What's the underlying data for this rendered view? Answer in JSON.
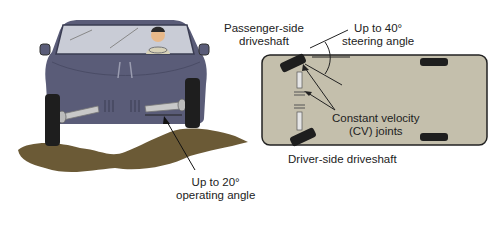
{
  "left_figure": {
    "name": "car-front-view",
    "label_operating_angle": [
      "Up to 20°",
      "operating angle"
    ]
  },
  "right_figure": {
    "name": "car-top-view",
    "label_passenger": [
      "Passenger-side",
      "driveshaft"
    ],
    "label_steering": [
      "Up to 40°",
      "steering angle"
    ],
    "label_cv": [
      "Constant velocity",
      "(CV) joints"
    ],
    "label_driver": "Driver-side driveshaft"
  },
  "colors": {
    "car_body": "#5a5c78",
    "mud": "#6b5a36",
    "chassis_plan": "#c4bfac",
    "tire": "#1e1e1e",
    "shaft": "#c8c8c8"
  }
}
